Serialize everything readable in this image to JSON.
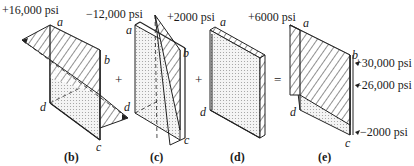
{
  "diagram": {
    "type": "stress distribution superposition",
    "operators": [
      "+",
      "+",
      "="
    ],
    "panels": [
      {
        "caption": "(b)",
        "stress_label": "+16,000 psi",
        "corners": [
          "a",
          "b",
          "c",
          "d"
        ]
      },
      {
        "caption": "(c)",
        "stress_label": "−12,000 psi",
        "corners": [
          "a",
          "b",
          "c",
          "d"
        ]
      },
      {
        "caption": "(d)",
        "stress_label": "+2000 psi",
        "corners": [
          "a",
          "d"
        ]
      },
      {
        "caption": "(e)",
        "stress_label": "+6000 psi",
        "corners": [
          "a",
          "b",
          "c",
          "d"
        ],
        "result_labels": [
          "+30,000 psi",
          "−26,000 psi",
          "−2000 psi"
        ]
      }
    ]
  }
}
